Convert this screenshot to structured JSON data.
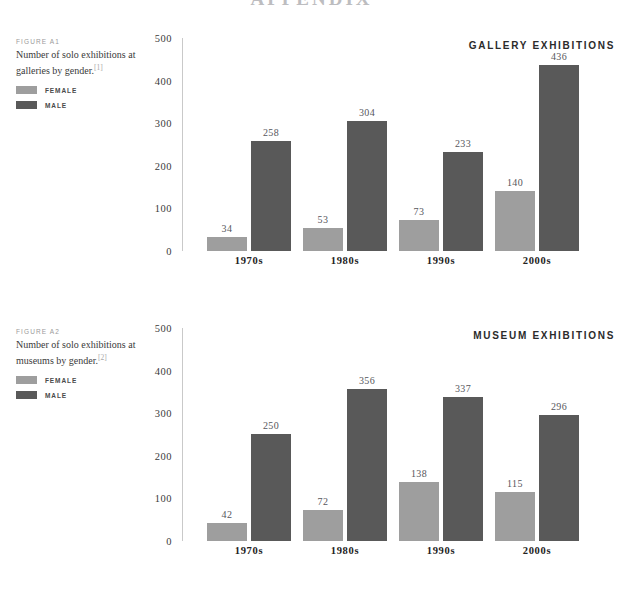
{
  "page": {
    "heading": "APPENDIX"
  },
  "colors": {
    "female": "#9e9e9e",
    "male": "#595959",
    "axis": "#c9c9c9",
    "value_label": "#56565b",
    "background": "#ffffff"
  },
  "legend": {
    "female_label": "FEMALE",
    "male_label": "MALE"
  },
  "figures": [
    {
      "kicker": "FIGURE A1",
      "caption": "Number of solo exhibitions at galleries by gender.",
      "reference": "[1]",
      "title": "GALLERY EXHIBITIONS"
    },
    {
      "kicker": "FIGURE A2",
      "caption": "Number of solo exhibitions at museums by gender.",
      "reference": "[2]",
      "title": "MUSEUM EXHIBITIONS"
    }
  ],
  "chart_data": [
    {
      "type": "bar",
      "title": "GALLERY EXHIBITIONS",
      "subtitle": "Number of solo exhibitions at galleries by gender.",
      "xlabel": "",
      "ylabel": "",
      "ylim": [
        0,
        500
      ],
      "yticks": [
        0,
        100,
        200,
        300,
        400,
        500
      ],
      "ytick_labels": [
        "0",
        "100",
        "200",
        "300",
        "400",
        "500"
      ],
      "grid": false,
      "legend_position": "top-left",
      "categories": [
        "1970s",
        "1980s",
        "1990s",
        "2000s"
      ],
      "series": [
        {
          "name": "FEMALE",
          "color": "#9e9e9e",
          "values": [
            34,
            53,
            73,
            140
          ]
        },
        {
          "name": "MALE",
          "color": "#595959",
          "values": [
            258,
            304,
            233,
            436
          ]
        }
      ]
    },
    {
      "type": "bar",
      "title": "MUSEUM EXHIBITIONS",
      "subtitle": "Number of solo exhibitions at museums by gender.",
      "xlabel": "",
      "ylabel": "",
      "ylim": [
        0,
        500
      ],
      "yticks": [
        0,
        100,
        200,
        300,
        400,
        500
      ],
      "ytick_labels": [
        "0",
        "100",
        "200",
        "300",
        "400",
        "500"
      ],
      "grid": false,
      "legend_position": "top-left",
      "categories": [
        "1970s",
        "1980s",
        "1990s",
        "2000s"
      ],
      "series": [
        {
          "name": "FEMALE",
          "color": "#9e9e9e",
          "values": [
            42,
            72,
            138,
            115
          ]
        },
        {
          "name": "MALE",
          "color": "#595959",
          "values": [
            250,
            356,
            337,
            296
          ]
        }
      ]
    }
  ]
}
